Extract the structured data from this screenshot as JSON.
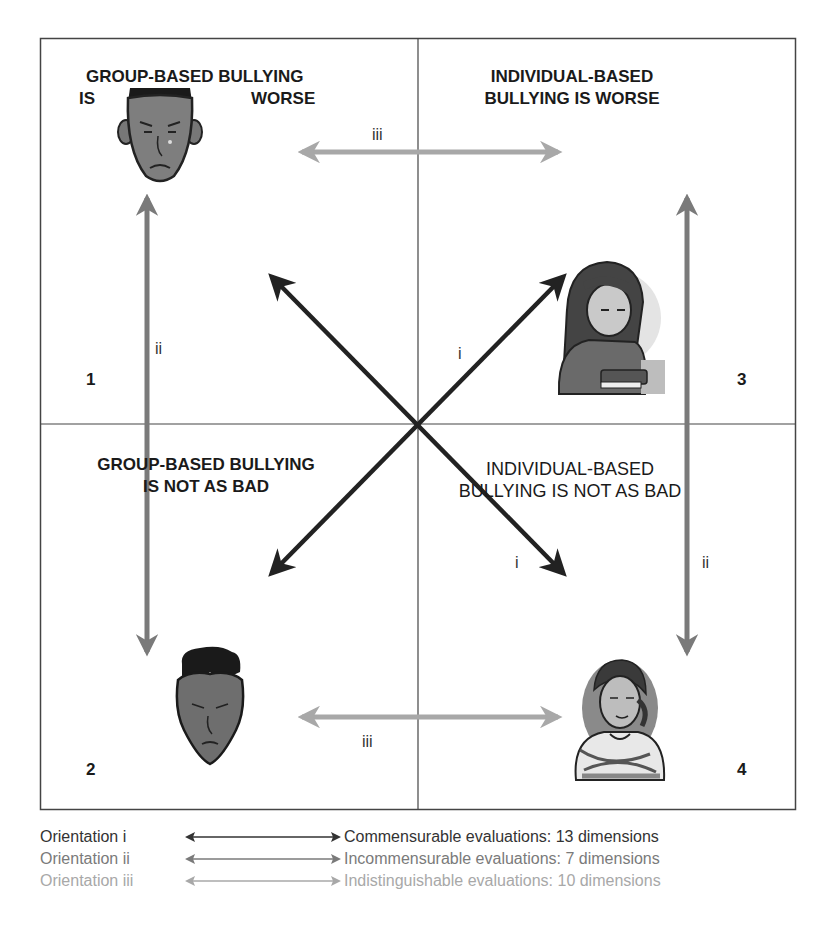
{
  "figure": {
    "quadrants": [
      {
        "number": "1",
        "heading_line1": "GROUP-BASED BULLYING",
        "heading_line2_left": "IS",
        "heading_line2_right": "WORSE",
        "illustration": "sad-boy-face-icon"
      },
      {
        "number": "2",
        "heading_line1": "GROUP-BASED BULLYING",
        "heading_line2": "IS NOT AS BAD",
        "illustration": "frowning-boy-face-icon"
      },
      {
        "number": "3",
        "heading_line1": "INDIVIDUAL-BASED",
        "heading_line2": "BULLYING IS WORSE",
        "illustration": "sad-girl-with-book-icon"
      },
      {
        "number": "4",
        "heading_line1": "INDIVIDUAL-BASED",
        "heading_line2": "BULLYING IS NOT AS BAD",
        "illustration": "girl-arms-crossed-icon"
      }
    ],
    "arrow_labels": {
      "diag_upper": "i",
      "diag_lower": "i",
      "vert_left": "ii",
      "vert_right": "ii",
      "horiz_top": "iii",
      "horiz_bottom": "iii"
    },
    "colors": {
      "orientation_i": "#222222",
      "orientation_ii": "#7a7a7a",
      "orientation_iii": "#a8a8a8",
      "border": "#444444",
      "text": "#1a1a1a"
    }
  },
  "legend": [
    {
      "name": "Orientation i",
      "description": "Commensurable evaluations: 13 dimensions",
      "color": "#333333"
    },
    {
      "name": "Orientation ii",
      "description": "Incommensurable evaluations: 7 dimensions",
      "color": "#7a7a7a"
    },
    {
      "name": "Orientation iii",
      "description": "Indistinguishable evaluations: 10 dimensions",
      "color": "#a8a8a8"
    }
  ]
}
